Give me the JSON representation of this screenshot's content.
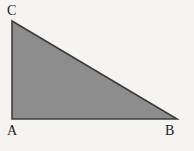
{
  "figure": {
    "type": "right-triangle",
    "vertex_labels": {
      "top_left": "C",
      "bottom_left": "A",
      "bottom_right": "B"
    },
    "geometry": {
      "points": "12,21 12,119 177,119"
    },
    "colors": {
      "background": "#f5f4f1",
      "fill": "#8d8d8d",
      "stroke": "#3d3d3d",
      "label": "#1c1c1c"
    }
  }
}
